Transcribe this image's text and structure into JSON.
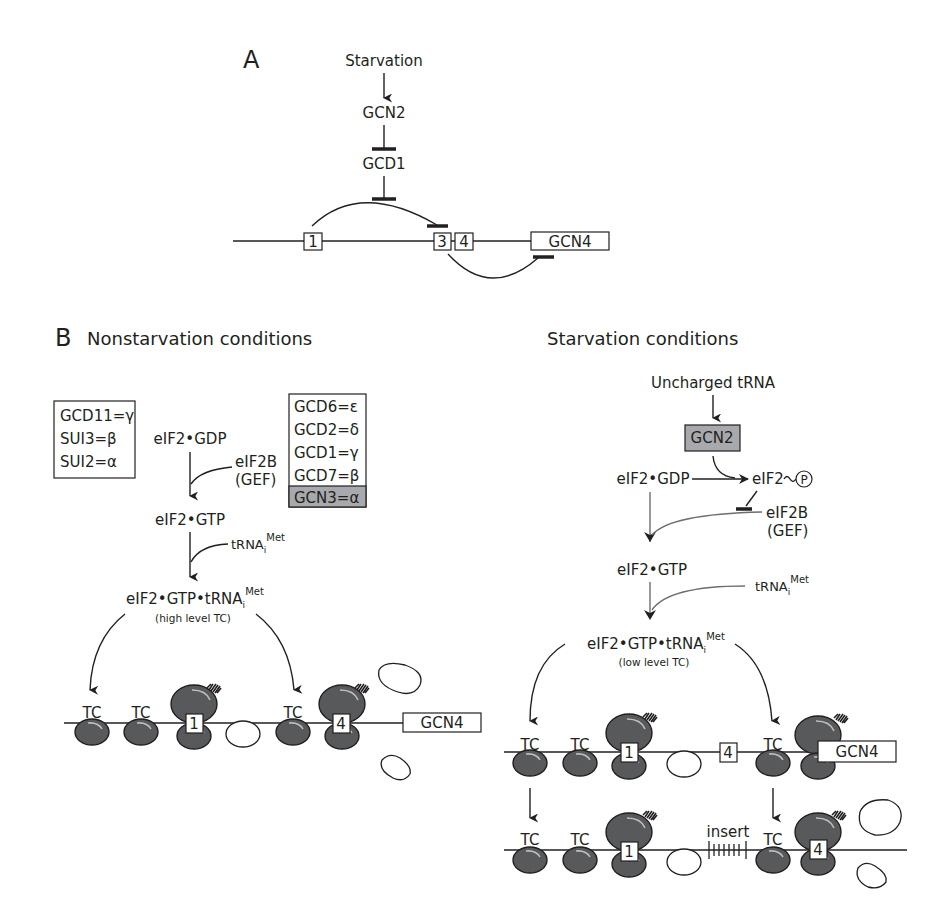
{
  "panel_a": {
    "label": "A",
    "starvation": "Starvation",
    "gcn2": "GCN2",
    "gcd1": "GCD1",
    "uorfs": [
      "1",
      "3",
      "4"
    ],
    "gene": "GCN4"
  },
  "panel_b": {
    "label": "B",
    "nonstarvation": {
      "title": "Nonstarvation conditions",
      "eif2_subunits": [
        "GCD11=γ",
        "SUI3=β",
        "SUI2=α"
      ],
      "eif2b_subunits": [
        "GCD6=ε",
        "GCD2=δ",
        "GCD1=γ",
        "GCD7=β"
      ],
      "eif2b_highlight": "GCN3=α",
      "eif2_gdp": "eIF2•GDP",
      "eif2b": "eIF2B",
      "gef": "(GEF)",
      "eif2_gtp": "eIF2•GTP",
      "trna": "tRNA",
      "trna_sub": "i",
      "trna_sup": "Met",
      "tc_complex": "eIF2•GTP•tRNA",
      "tc_level": "(high level TC)",
      "tc": "TC",
      "uorf1": "1",
      "uorf4": "4",
      "gene": "GCN4"
    },
    "starvation": {
      "title": "Starvation conditions",
      "uncharged_trna": "Uncharged tRNA",
      "gcn2": "GCN2",
      "eif2_gdp": "eIF2•GDP",
      "eif2_p": "eIF2",
      "phospho": "P",
      "eif2b": "eIF2B",
      "gef": "(GEF)",
      "eif2_gtp": "eIF2•GTP",
      "trna": "tRNA",
      "trna_sub": "i",
      "trna_sup": "Met",
      "tc_complex": "eIF2•GTP•tRNA",
      "tc_level": "(low level TC)",
      "tc": "TC",
      "uorf1": "1",
      "uorf4": "4",
      "gene": "GCN4",
      "insert": "insert"
    }
  },
  "colors": {
    "ink": "#231f20",
    "ribosome": "#58595b",
    "highlight_box": "#a7a9ac",
    "gray_arrow": "#6d6e71"
  }
}
